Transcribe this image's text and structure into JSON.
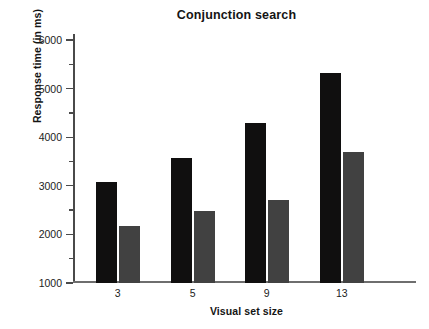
{
  "chart_data": {
    "type": "bar",
    "title": "Conjunction search",
    "xlabel": "Visual set size",
    "ylabel": "Response time (in ms)",
    "categories": [
      "3",
      "5",
      "9",
      "13"
    ],
    "series": [
      {
        "name": "target-absent",
        "color": "#100f0f",
        "values": [
          3080,
          3580,
          4290,
          5330
        ]
      },
      {
        "name": "target-present",
        "color": "#414141",
        "values": [
          2170,
          2480,
          2710,
          3690
        ]
      }
    ],
    "ylim": [
      1000,
      6000
    ],
    "y_major_ticks": [
      1000,
      2000,
      3000,
      4000,
      5000,
      6000
    ],
    "y_minor_ticks": [
      1500,
      2500,
      3500,
      4500,
      5500
    ],
    "y_tick_labels": [
      "1000",
      "2000",
      "3000",
      "4000",
      "5000",
      "6000"
    ],
    "grid": false,
    "legend": "none"
  }
}
